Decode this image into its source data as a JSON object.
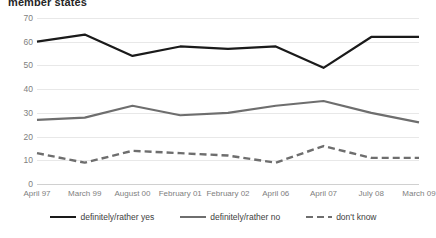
{
  "chart_data": {
    "type": "line",
    "title": "member states",
    "xlabel": "",
    "ylabel": "",
    "ylim": [
      0,
      70
    ],
    "yticks": [
      70,
      60,
      50,
      40,
      30,
      20,
      10,
      0
    ],
    "grid": true,
    "legend_position": "bottom",
    "categories": [
      "April 97",
      "March 99",
      "August 00",
      "February 01",
      "February 02",
      "April 06",
      "April 07",
      "July 08",
      "March 09"
    ],
    "series": [
      {
        "name": "definitely/rather yes",
        "color": "#1a1a1a",
        "style": "solid",
        "values": [
          60,
          63,
          54,
          58,
          57,
          58,
          49,
          62,
          62
        ]
      },
      {
        "name": "definitely/rather no",
        "color": "#6e6e6e",
        "style": "solid",
        "values": [
          27,
          28,
          33,
          29,
          30,
          33,
          35,
          30,
          26
        ]
      },
      {
        "name": "don't know",
        "color": "#6e6e6e",
        "style": "dashed",
        "values": [
          13,
          9,
          14,
          13,
          12,
          9,
          16,
          11,
          11
        ]
      }
    ]
  }
}
